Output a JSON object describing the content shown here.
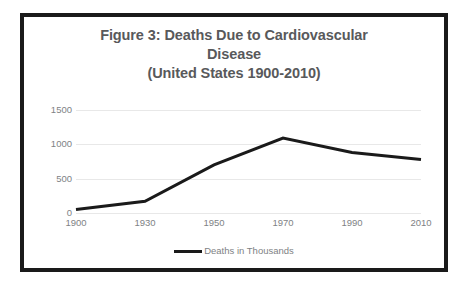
{
  "figure": {
    "title_lines": [
      "Figure 3:  Deaths Due to Cardiovascular",
      "Disease",
      "(United States 1900-2010)"
    ],
    "frame_color": "#1a1a1a",
    "background": "#ffffff"
  },
  "chart_data": {
    "type": "line",
    "title": "Figure 3:  Deaths Due to Cardiovascular Disease (United States 1900-2010)",
    "xlabel": "",
    "ylabel": "",
    "categories": [
      "1900",
      "1930",
      "1950",
      "1970",
      "1990",
      "2010"
    ],
    "x": [
      1900,
      1930,
      1950,
      1970,
      1990,
      2010
    ],
    "series": [
      {
        "name": "Deaths in Thousands",
        "values": [
          50,
          170,
          700,
          1090,
          880,
          780
        ],
        "color": "#1a1a1a",
        "line_width": 3
      }
    ],
    "ylim": [
      0,
      1500
    ],
    "yticks": [
      0,
      500,
      1000,
      1500
    ],
    "ytick_labels": [
      "0",
      "500",
      "1000",
      "1500"
    ],
    "xtick_labels": [
      "1900",
      "1930",
      "1950",
      "1970",
      "1990",
      "2010"
    ],
    "grid": true,
    "grid_color": "#e8e8e8",
    "legend": {
      "position": "bottom",
      "entries": [
        "Deaths in Thousands"
      ]
    },
    "tick_label_color": "#808285",
    "title_color": "#58595b"
  }
}
